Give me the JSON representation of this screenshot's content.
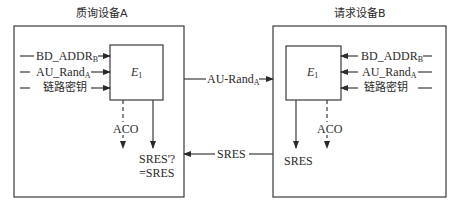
{
  "diagram": {
    "type": "authentication-flow",
    "colors": {
      "line": "#3a3a3a",
      "background": "#ffffff"
    },
    "verifier": {
      "title": "质询设备A",
      "function_block": {
        "name": "E",
        "subscript": "1"
      },
      "inputs": [
        {
          "text": "BD_ADDR",
          "sub": "B"
        },
        {
          "text": "AU_Rand",
          "sub": "A"
        },
        {
          "text": "链路密钥",
          "sub": ""
        }
      ],
      "outputs": {
        "aco": "ACO",
        "compare_line1": "SRES'?",
        "compare_line2": "=SRES"
      }
    },
    "claimant": {
      "title": "请求设备B",
      "function_block": {
        "name": "E",
        "subscript": "1"
      },
      "inputs": [
        {
          "text": "BD_ADDR",
          "sub": "B"
        },
        {
          "text": "AU_Rand",
          "sub": "A"
        },
        {
          "text": "链路密钥",
          "sub": ""
        }
      ],
      "outputs": {
        "sres": "SRES",
        "aco": "ACO"
      }
    },
    "messages": [
      {
        "direction": "A→B",
        "text": "AU-Rand",
        "sub": "A"
      },
      {
        "direction": "B→A",
        "text": "SRES",
        "sub": ""
      }
    ]
  }
}
